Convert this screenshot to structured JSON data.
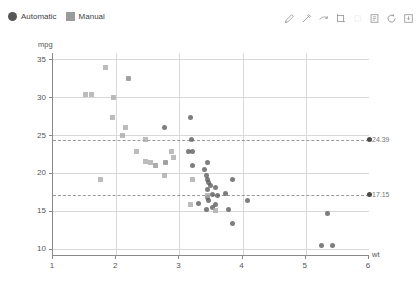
{
  "legend": {
    "position": "top-left",
    "entries": [
      {
        "label": "Automatic",
        "marker": "circle",
        "color": "#565656"
      },
      {
        "label": "Manual",
        "marker": "square",
        "color": "#9b9b9b"
      }
    ]
  },
  "toolbar": {
    "items": [
      {
        "name": "edit-pencil-icon",
        "active": true
      },
      {
        "name": "pen-icon",
        "active": true
      },
      {
        "name": "eraser-icon",
        "active": true
      },
      {
        "name": "crop-icon",
        "active": true
      },
      {
        "name": "select-rect-icon",
        "active": false
      },
      {
        "name": "notes-icon",
        "active": true
      },
      {
        "name": "refresh-icon",
        "active": true
      },
      {
        "name": "save-icon",
        "active": true
      }
    ]
  },
  "chart_data": {
    "type": "scatter",
    "title": "",
    "xlabel": "wt",
    "ylabel": "mpg",
    "xlim": [
      1,
      6
    ],
    "ylim": [
      9.2,
      35.8
    ],
    "xticks": [
      "1",
      "2",
      "3",
      "4",
      "5",
      "6"
    ],
    "yticks": [
      "10",
      "15",
      "20",
      "25",
      "30",
      "35"
    ],
    "grid": true,
    "legend_position": "top-left",
    "reference_lines": [
      {
        "label": "24.39",
        "value": 24.39,
        "style": "dashed",
        "color": "#9a9a9a"
      },
      {
        "label": "17.15",
        "value": 17.15,
        "style": "dashed",
        "color": "#9a9a9a"
      }
    ],
    "series": [
      {
        "name": "Automatic",
        "marker": "circle",
        "color": "#5a5a5a",
        "points": [
          [
            3.215,
            21.0
          ],
          [
            3.215,
            22.8
          ],
          [
            3.44,
            21.4
          ],
          [
            3.46,
            18.7
          ],
          [
            3.57,
            18.1
          ],
          [
            3.19,
            24.4
          ],
          [
            3.15,
            22.8
          ],
          [
            3.44,
            19.2
          ],
          [
            3.44,
            17.8
          ],
          [
            4.07,
            16.4
          ],
          [
            3.73,
            17.3
          ],
          [
            3.78,
            15.2
          ],
          [
            5.25,
            10.4
          ],
          [
            5.424,
            10.4
          ],
          [
            5.345,
            14.7
          ],
          [
            2.2,
            32.4
          ],
          [
            3.52,
            15.5
          ],
          [
            3.435,
            15.2
          ],
          [
            3.84,
            13.3
          ],
          [
            3.845,
            19.2
          ],
          [
            3.17,
            27.3
          ],
          [
            2.77,
            26.0
          ],
          [
            3.57,
            15.8
          ],
          [
            2.78,
            21.4
          ],
          [
            3.46,
            16.4
          ],
          [
            3.52,
            17.15
          ],
          [
            3.4,
            20.5
          ],
          [
            3.43,
            19.7
          ],
          [
            3.49,
            18.3
          ],
          [
            3.45,
            16.8
          ],
          [
            3.3,
            16.0
          ],
          [
            3.6,
            17.0
          ]
        ]
      },
      {
        "name": "Manual",
        "marker": "square",
        "color": "#a9a9a9",
        "points": [
          [
            1.513,
            30.4
          ],
          [
            1.615,
            30.4
          ],
          [
            1.835,
            33.9
          ],
          [
            1.935,
            27.3
          ],
          [
            2.14,
            26.0
          ],
          [
            2.32,
            22.8
          ],
          [
            2.465,
            21.5
          ],
          [
            2.62,
            21.0
          ],
          [
            2.77,
            19.7
          ],
          [
            2.875,
            22.8
          ],
          [
            2.2,
            32.4
          ],
          [
            3.17,
            15.8
          ],
          [
            3.57,
            15.0
          ],
          [
            1.75,
            19.2
          ],
          [
            2.78,
            21.4
          ],
          [
            2.465,
            24.4
          ],
          [
            2.62,
            21.0
          ],
          [
            3.215,
            19.2
          ],
          [
            2.9,
            22.0
          ],
          [
            2.55,
            21.4
          ],
          [
            3.44,
            17.0
          ],
          [
            1.95,
            30.0
          ],
          [
            2.1,
            25.0
          ]
        ]
      }
    ]
  }
}
